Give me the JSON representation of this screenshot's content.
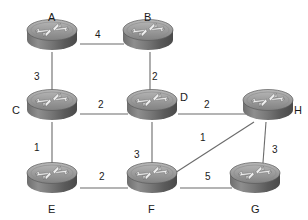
{
  "diagram": {
    "type": "network-graph",
    "canvas": {
      "width": 308,
      "height": 220
    },
    "background_color": "#ffffff",
    "node_icon": "router-icon",
    "edge_color": "#6b6b6b",
    "label_color": "#1a1a1a",
    "nodes": [
      {
        "id": "A",
        "label": "A",
        "x": 52,
        "y": 40,
        "label_x": 48,
        "label_y": 12
      },
      {
        "id": "B",
        "label": "B",
        "x": 148,
        "y": 40,
        "label_x": 144,
        "label_y": 12
      },
      {
        "id": "C",
        "label": "C",
        "x": 52,
        "y": 110,
        "label_x": 12,
        "label_y": 105
      },
      {
        "id": "D",
        "label": "D",
        "x": 152,
        "y": 110,
        "label_x": 180,
        "label_y": 92
      },
      {
        "id": "H",
        "label": "H",
        "x": 268,
        "y": 110,
        "label_x": 294,
        "label_y": 105
      },
      {
        "id": "E",
        "label": "E",
        "x": 52,
        "y": 183,
        "label_x": 48,
        "label_y": 204
      },
      {
        "id": "F",
        "label": "F",
        "x": 152,
        "y": 183,
        "label_x": 148,
        "label_y": 204
      },
      {
        "id": "G",
        "label": "G",
        "x": 255,
        "y": 183,
        "label_x": 251,
        "label_y": 204
      }
    ],
    "edges": [
      {
        "id": "A-B",
        "from": "A",
        "to": "B",
        "weight": "4",
        "x1": 80,
        "y1": 44,
        "x2": 124,
        "y2": 44,
        "label_x": 95,
        "label_y": 30
      },
      {
        "id": "A-C",
        "from": "A",
        "to": "C",
        "weight": "3",
        "x1": 52,
        "y1": 52,
        "x2": 52,
        "y2": 104,
        "label_x": 34,
        "label_y": 72
      },
      {
        "id": "B-D",
        "from": "B",
        "to": "D",
        "weight": "2",
        "x1": 150,
        "y1": 52,
        "x2": 150,
        "y2": 104,
        "label_x": 152,
        "label_y": 72
      },
      {
        "id": "C-D",
        "from": "C",
        "to": "D",
        "weight": "2",
        "x1": 80,
        "y1": 114,
        "x2": 128,
        "y2": 114,
        "label_x": 98,
        "label_y": 100
      },
      {
        "id": "D-H",
        "from": "D",
        "to": "H",
        "weight": "2",
        "x1": 178,
        "y1": 114,
        "x2": 246,
        "y2": 114,
        "label_x": 204,
        "label_y": 100
      },
      {
        "id": "C-E",
        "from": "C",
        "to": "E",
        "weight": "1",
        "x1": 52,
        "y1": 122,
        "x2": 52,
        "y2": 176,
        "label_x": 34,
        "label_y": 143
      },
      {
        "id": "D-F",
        "from": "D",
        "to": "F",
        "weight": "3",
        "x1": 152,
        "y1": 122,
        "x2": 152,
        "y2": 176,
        "label_x": 134,
        "label_y": 150
      },
      {
        "id": "F-H",
        "from": "F",
        "to": "H",
        "weight": "1",
        "x1": 164,
        "y1": 180,
        "x2": 254,
        "y2": 122,
        "label_x": 200,
        "label_y": 133
      },
      {
        "id": "E-F",
        "from": "E",
        "to": "F",
        "weight": "2",
        "x1": 80,
        "y1": 188,
        "x2": 128,
        "y2": 188,
        "label_x": 99,
        "label_y": 172
      },
      {
        "id": "F-G",
        "from": "F",
        "to": "G",
        "weight": "5",
        "x1": 180,
        "y1": 188,
        "x2": 232,
        "y2": 188,
        "label_x": 205,
        "label_y": 172
      },
      {
        "id": "G-H",
        "from": "G",
        "to": "H",
        "weight": "3",
        "x1": 266,
        "y1": 122,
        "x2": 262,
        "y2": 176,
        "label_x": 272,
        "label_y": 145
      }
    ]
  }
}
